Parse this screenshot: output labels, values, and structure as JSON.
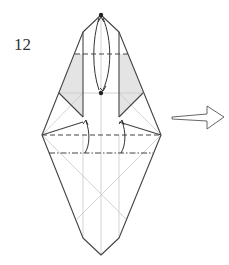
{
  "diagram": {
    "step_number": "12",
    "colors": {
      "line": "#444444",
      "crease": "#c8c8c8",
      "shade": "#e4e4e4",
      "dot": "#222222"
    },
    "symbols": [
      "valley-fold-dashed-line",
      "mountain-fold-dash-dot-line",
      "fold-arrow",
      "next-step-hollow-arrow",
      "reference-dots"
    ]
  }
}
